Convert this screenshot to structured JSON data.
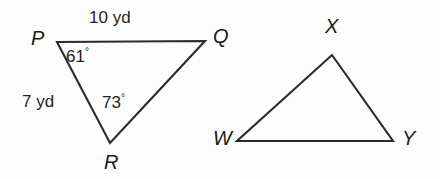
{
  "figure": {
    "background_color": "#fdfdfd",
    "stroke_color": "#2b2b2b",
    "text_color": "#1a1a1a",
    "triangles": [
      {
        "name": "triangle-pqr",
        "vertices": [
          {
            "label": "P",
            "x": 57,
            "y": 42
          },
          {
            "label": "Q",
            "x": 205,
            "y": 41
          },
          {
            "label": "R",
            "x": 110,
            "y": 143
          }
        ],
        "vertex_labels": [
          {
            "id": "vertex-label-p",
            "text": "P",
            "x": 31,
            "y": 28
          },
          {
            "id": "vertex-label-q",
            "text": "Q",
            "x": 213,
            "y": 26
          },
          {
            "id": "vertex-label-r",
            "text": "R",
            "x": 104,
            "y": 152
          }
        ],
        "side_labels": [
          {
            "id": "side-label-pq",
            "text": "10 yd",
            "x": 89,
            "y": 9
          },
          {
            "id": "side-label-pr",
            "text": "7 yd",
            "x": 22,
            "y": 93
          }
        ],
        "angle_labels": [
          {
            "id": "angle-label-p",
            "value": "61",
            "unit": "°",
            "x": 66,
            "y": 47
          },
          {
            "id": "angle-label-r",
            "value": "73",
            "unit": "°",
            "x": 102,
            "y": 93
          }
        ]
      },
      {
        "name": "triangle-wxy",
        "vertices": [
          {
            "label": "X",
            "x": 332,
            "y": 55
          },
          {
            "label": "Y",
            "x": 393,
            "y": 141
          },
          {
            "label": "W",
            "x": 237,
            "y": 141
          }
        ],
        "vertex_labels": [
          {
            "id": "vertex-label-x",
            "text": "X",
            "x": 325,
            "y": 16
          },
          {
            "id": "vertex-label-w",
            "text": "W",
            "x": 213,
            "y": 128
          },
          {
            "id": "vertex-label-y",
            "text": "Y",
            "x": 402,
            "y": 128
          }
        ],
        "side_labels": [],
        "angle_labels": []
      }
    ]
  }
}
